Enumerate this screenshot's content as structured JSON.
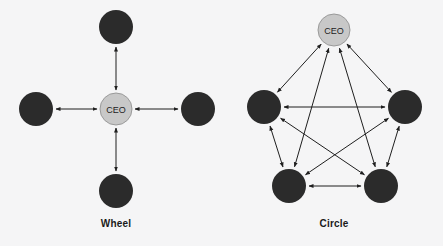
{
  "figure": {
    "width": 443,
    "height": 246,
    "background_color": "#f5f5f6"
  },
  "style": {
    "member_node_color": "#2b2b2b",
    "leader_node_color": "#c8c8c8",
    "leader_node_stroke": "#9a9a9a",
    "edge_color": "#1f1f1f",
    "edge_width": 1,
    "label_color": "#1a1a1a",
    "leader_label_color": "#222222"
  },
  "chart_data": {
    "type": "diagram",
    "subtype": "node-link-network",
    "title": "",
    "diagrams": [
      {
        "id": "wheel",
        "label": "Wheel",
        "label_x": 116,
        "label_y": 218,
        "node_radius_member": 17,
        "node_radius_leader": 16,
        "edge_style": "bidirectional",
        "nodes": [
          {
            "id": "w-ceo",
            "label": "CEO",
            "role": "leader",
            "x": 116,
            "y": 109,
            "r": 16,
            "color": "#c8c8c8"
          },
          {
            "id": "w-top",
            "label": "",
            "role": "member",
            "x": 116,
            "y": 27,
            "r": 17,
            "color": "#2b2b2b"
          },
          {
            "id": "w-left",
            "label": "",
            "role": "member",
            "x": 36,
            "y": 109,
            "r": 17,
            "color": "#2b2b2b"
          },
          {
            "id": "w-right",
            "label": "",
            "role": "member",
            "x": 198,
            "y": 109,
            "r": 17,
            "color": "#2b2b2b"
          },
          {
            "id": "w-bottom",
            "label": "",
            "role": "member",
            "x": 116,
            "y": 191,
            "r": 17,
            "color": "#2b2b2b"
          }
        ],
        "edges": [
          {
            "from": "w-ceo",
            "to": "w-top",
            "directed": "both"
          },
          {
            "from": "w-ceo",
            "to": "w-left",
            "directed": "both"
          },
          {
            "from": "w-ceo",
            "to": "w-right",
            "directed": "both"
          },
          {
            "from": "w-ceo",
            "to": "w-bottom",
            "directed": "both"
          }
        ],
        "edge_count": 4
      },
      {
        "id": "circle",
        "label": "Circle",
        "label_x": 334,
        "label_y": 218,
        "node_radius_member": 17,
        "node_radius_leader": 16,
        "edge_style": "bidirectional",
        "nodes": [
          {
            "id": "c-ceo",
            "label": "CEO",
            "role": "leader",
            "x": 334,
            "y": 30,
            "r": 16,
            "color": "#c8c8c8"
          },
          {
            "id": "c-ul",
            "label": "",
            "role": "member",
            "x": 264,
            "y": 107,
            "r": 17,
            "color": "#2b2b2b"
          },
          {
            "id": "c-ur",
            "label": "",
            "role": "member",
            "x": 405,
            "y": 107,
            "r": 17,
            "color": "#2b2b2b"
          },
          {
            "id": "c-bl",
            "label": "",
            "role": "member",
            "x": 289,
            "y": 186,
            "r": 17,
            "color": "#2b2b2b"
          },
          {
            "id": "c-br",
            "label": "",
            "role": "member",
            "x": 381,
            "y": 186,
            "r": 17,
            "color": "#2b2b2b"
          }
        ],
        "edges": [
          {
            "from": "c-ceo",
            "to": "c-ul",
            "directed": "both"
          },
          {
            "from": "c-ceo",
            "to": "c-ur",
            "directed": "both"
          },
          {
            "from": "c-ceo",
            "to": "c-bl",
            "directed": "both"
          },
          {
            "from": "c-ceo",
            "to": "c-br",
            "directed": "both"
          },
          {
            "from": "c-ul",
            "to": "c-ur",
            "directed": "both"
          },
          {
            "from": "c-ul",
            "to": "c-bl",
            "directed": "both"
          },
          {
            "from": "c-ul",
            "to": "c-br",
            "directed": "both"
          },
          {
            "from": "c-ur",
            "to": "c-bl",
            "directed": "both"
          },
          {
            "from": "c-ur",
            "to": "c-br",
            "directed": "both"
          },
          {
            "from": "c-bl",
            "to": "c-br",
            "directed": "both"
          }
        ],
        "edge_count": 10
      }
    ]
  }
}
